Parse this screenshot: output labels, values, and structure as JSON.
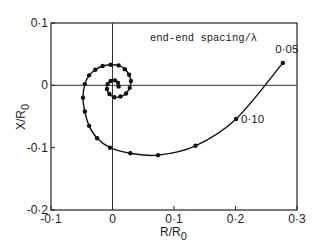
{
  "chart_data": {
    "type": "line",
    "title": "",
    "annotation": "end-end spacing/λ",
    "xlabel": "R/R",
    "xlabel_sub": "0",
    "ylabel": "X/R",
    "ylabel_sub": "0",
    "xlim": [
      -0.1,
      0.3
    ],
    "ylim": [
      -0.2,
      0.1
    ],
    "x_ticks": [
      -0.1,
      0,
      0.1,
      0.2,
      0.3
    ],
    "x_tick_labels": [
      "-0·1",
      "0",
      "0·1",
      "0·2",
      "0·3"
    ],
    "y_ticks": [
      -0.2,
      -0.1,
      0,
      0.1
    ],
    "y_tick_labels": [
      "-0·2",
      "-0·1",
      "0",
      "0·1"
    ],
    "grid": false,
    "zero_lines": true,
    "legend": null,
    "point_labels": [
      {
        "text": "0·05",
        "x": 0.277,
        "y": 0.036
      },
      {
        "text": "0·10",
        "x": 0.201,
        "y": -0.054
      }
    ],
    "series": [
      {
        "name": "impedance locus",
        "marker": "dot",
        "points": [
          [
            0.277,
            0.036
          ],
          [
            0.201,
            -0.054
          ],
          [
            0.135,
            -0.097
          ],
          [
            0.074,
            -0.112
          ],
          [
            0.029,
            -0.109
          ],
          [
            -0.004,
            -0.1
          ],
          [
            -0.025,
            -0.085
          ],
          [
            -0.038,
            -0.065
          ],
          [
            -0.045,
            -0.042
          ],
          [
            -0.048,
            -0.02
          ],
          [
            -0.045,
            0.002
          ],
          [
            -0.038,
            0.016
          ],
          [
            -0.028,
            0.025
          ],
          [
            -0.016,
            0.031
          ],
          [
            -0.003,
            0.033
          ],
          [
            0.01,
            0.032
          ],
          [
            0.02,
            0.026
          ],
          [
            0.027,
            0.017
          ],
          [
            0.03,
            0.007
          ],
          [
            0.028,
            -0.004
          ],
          [
            0.022,
            -0.013
          ],
          [
            0.013,
            -0.018
          ],
          [
            0.003,
            -0.019
          ],
          [
            -0.005,
            -0.014
          ],
          [
            -0.009,
            -0.006
          ],
          [
            -0.008,
            0.002
          ],
          [
            -0.003,
            0.007
          ],
          [
            0.004,
            0.008
          ],
          [
            0.009,
            0.004
          ],
          [
            0.01,
            -0.002
          ]
        ]
      }
    ]
  }
}
